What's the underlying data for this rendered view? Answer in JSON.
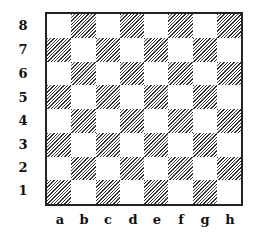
{
  "board": {
    "ranks": [
      "8",
      "7",
      "6",
      "5",
      "4",
      "3",
      "2",
      "1"
    ],
    "files": [
      "a",
      "b",
      "c",
      "d",
      "e",
      "f",
      "g",
      "h"
    ],
    "dark_square_pattern": "diagonal-hatch",
    "colors": {
      "light": "#ffffff",
      "dark": "#333333",
      "border": "#222222"
    }
  }
}
